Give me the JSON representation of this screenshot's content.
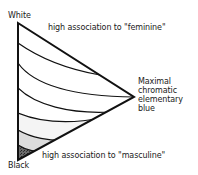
{
  "diagram": {
    "vertices": {
      "top": "White",
      "bottom": "Black",
      "right": [
        "Maximal",
        "chromatic",
        "elementary",
        "blue"
      ]
    },
    "annotations": {
      "top_edge": "high association to \"feminine\"",
      "bottom_edge": "high association to \"masculine\""
    },
    "colors": {
      "outline": "#111111",
      "band_light": "#ffffff",
      "band_gray_1": "#e6e6e6",
      "band_gray_2": "#bdbdbd",
      "band_dark": "#4a4a4a"
    }
  }
}
